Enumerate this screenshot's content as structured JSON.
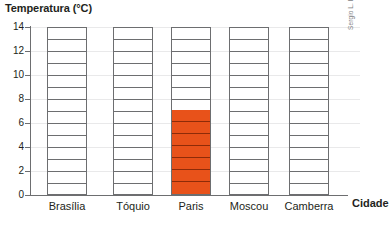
{
  "chart_data": {
    "type": "bar",
    "title": "Temperatura (°C)",
    "xlabel": "Cidade",
    "ylabel": "Temperatura (°C)",
    "categories": [
      "Brasília",
      "Tóquio",
      "Paris",
      "Moscou",
      "Camberra"
    ],
    "values": [
      null,
      null,
      7,
      null,
      null
    ],
    "series": [
      {
        "name": "Temperatura",
        "values": [
          null,
          null,
          7,
          null,
          null
        ]
      }
    ],
    "ylim": [
      0,
      14
    ],
    "ytick_step": 2,
    "ytick_labels": [
      "0",
      "2",
      "4",
      "6",
      "8",
      "10",
      "12",
      "14"
    ],
    "ytick_values": [
      0,
      2,
      4,
      6,
      8,
      10,
      12,
      14
    ],
    "grid": true,
    "legend": "none",
    "bar_style": "segmented-outline-ladder",
    "segment_unit": 1,
    "segments_per_bar": 14,
    "highlight_category": "Paris",
    "highlight_value": 7
  },
  "colors": {
    "fill": "#e8521a",
    "fill_segment_line": "#8e2b08",
    "outline": "#6d6e70",
    "gridline": "#e9e9ea",
    "text": "#231f20",
    "credit_text": "#808184",
    "background": "#ffffff"
  },
  "credit": {
    "text": "Sergio L. Filho/ID/BR"
  }
}
